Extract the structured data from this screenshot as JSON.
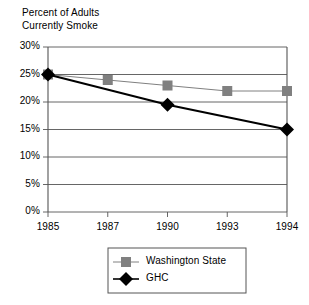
{
  "chart_data": {
    "type": "line",
    "title_line1": "Percent of Adults",
    "title_line2": "Currently Smoke",
    "xlabel": "",
    "ylabel": "",
    "categories": [
      "1985",
      "1987",
      "1990",
      "1993",
      "1994"
    ],
    "ylim": [
      0,
      30
    ],
    "ytick_labels": [
      "30%",
      "25%",
      "20%",
      "15%",
      "10%",
      "5%",
      "0%"
    ],
    "ytick_values": [
      30,
      25,
      20,
      15,
      10,
      5,
      0
    ],
    "grid": "horizontal",
    "legend_position": "bottom",
    "series": [
      {
        "name": "Washington State",
        "marker": "square",
        "color": "#808080",
        "values": [
          25,
          24,
          23,
          22,
          22
        ]
      },
      {
        "name": "GHC",
        "marker": "diamond",
        "color": "#000000",
        "values": [
          25,
          null,
          19.5,
          null,
          15
        ]
      }
    ]
  }
}
